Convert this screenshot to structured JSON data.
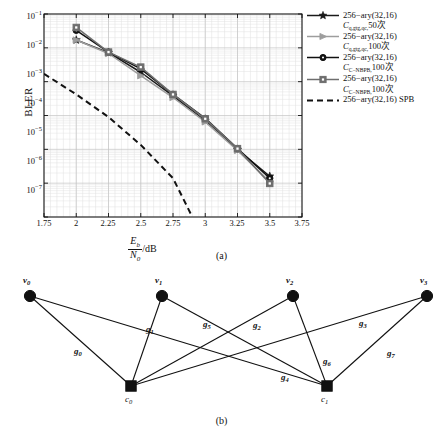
{
  "figure": {
    "panel_a_caption": "(a)",
    "panel_b_caption": "(b)"
  },
  "chart_data": {
    "type": "line",
    "title": "",
    "xlabel": "Eb/N0 /dB",
    "ylabel": "BLER",
    "xlim": [
      1.75,
      3.75
    ],
    "ylim": [
      1e-07,
      0.1
    ],
    "yscale": "log",
    "grid": true,
    "legend_position": "right-outside",
    "xticks": [
      "1.75",
      "2",
      "2.25",
      "2.5",
      "2.75",
      "3",
      "3.25",
      "3.5",
      "3.75"
    ],
    "xtick_values": [
      1.75,
      2,
      2.25,
      2.5,
      2.75,
      3,
      3.25,
      3.5,
      3.75
    ],
    "yticks": [
      "10-1",
      "10-2",
      "10-3",
      "10-4",
      "10-5",
      "10-6",
      "10-7"
    ],
    "ytick_values": [
      0.1,
      0.01,
      0.001,
      0.0001,
      1e-05,
      1e-06,
      1e-07
    ],
    "series": [
      {
        "name": "256-ary(32,16) C_q,gtg,qc, 50 times",
        "marker": "star",
        "color": "#1a1a1a",
        "linestyle": "solid",
        "x": [
          2,
          2.25,
          2.5,
          2.75,
          3,
          3.25,
          3.5
        ],
        "y": [
          0.017,
          0.0072,
          0.0019,
          0.00038,
          7e-05,
          9.8e-06,
          1.6e-06
        ]
      },
      {
        "name": "256-ary(32,16) C_q,gtg,qc, 100 times",
        "marker": "triangle-right",
        "color": "#9d9d9d",
        "linestyle": "solid",
        "x": [
          2,
          2.25,
          2.5,
          2.75,
          3,
          3.25,
          3.5
        ],
        "y": [
          0.017,
          0.0068,
          0.0015,
          0.00034,
          6.5e-05,
          9.3e-06,
          1.1e-06
        ]
      },
      {
        "name": "256-ary(32,16) C_C-NBPB, 100 times",
        "marker": "circle",
        "color": "#111111",
        "linestyle": "solid",
        "x": [
          2,
          2.25,
          2.5,
          2.75,
          3,
          3.25,
          3.5
        ],
        "y": [
          0.033,
          0.0075,
          0.0024,
          0.00042,
          8.2e-05,
          1.05e-05,
          1.4e-06
        ]
      },
      {
        "name": "256-ary(32,16) C_C-NBPB, 100 times",
        "marker": "square",
        "color": "#6e6e6e",
        "linestyle": "solid",
        "x": [
          2,
          2.25,
          2.5,
          2.75,
          3,
          3.25,
          3.5
        ],
        "y": [
          0.04,
          0.0075,
          0.0027,
          0.00042,
          8e-05,
          1.05e-05,
          9.8e-07
        ]
      },
      {
        "name": "256-ary(32,16) SPB",
        "marker": "none",
        "color": "#111111",
        "linestyle": "dashed",
        "x": [
          1.75,
          2.0,
          2.25,
          2.5,
          2.75,
          2.9
        ],
        "y": [
          0.0017,
          0.00042,
          9e-05,
          1.35e-05,
          1.4e-06,
          1e-07
        ]
      }
    ],
    "legend": [
      {
        "marker": "star",
        "color": "#1a1a1a",
        "line1": "256−ary(32,16)",
        "line2_sym": "C",
        "line2_sub": "q,gtg,qc,",
        "line2_rest": "50次"
      },
      {
        "marker": "triangle-right",
        "color": "#9d9d9d",
        "line1": "256−ary(32,16)",
        "line2_sym": "C",
        "line2_sub": "q,gtg,qc,",
        "line2_rest": "100次"
      },
      {
        "marker": "circle",
        "color": "#111111",
        "line1": "256−ary(32,16)",
        "line2_sym": "C",
        "line2_sub": "C−NBPB,",
        "line2_rest": "100次"
      },
      {
        "marker": "square",
        "color": "#6e6e6e",
        "line1": "256−ary(32,16)",
        "line2_sym": "C",
        "line2_sub": "C−NBPB,",
        "line2_rest": "100次"
      },
      {
        "marker": "dashed-line",
        "color": "#111111",
        "line1": "256−ary(32,16) SPB",
        "line2_sym": "",
        "line2_sub": "",
        "line2_rest": ""
      }
    ]
  },
  "graph_b": {
    "variable_nodes": [
      {
        "id": "v0",
        "label_sym": "v",
        "label_sub": "0",
        "x": 30,
        "y": 28
      },
      {
        "id": "v1",
        "label_sym": "v",
        "label_sub": "1",
        "x": 162,
        "y": 28
      },
      {
        "id": "v2",
        "label_sym": "v",
        "label_sub": "2",
        "x": 293,
        "y": 28
      },
      {
        "id": "v3",
        "label_sym": "v",
        "label_sub": "3",
        "x": 427,
        "y": 28
      }
    ],
    "check_nodes": [
      {
        "id": "c0",
        "label_sym": "c",
        "label_sub": "0",
        "x": 131,
        "y": 118
      },
      {
        "id": "c1",
        "label_sym": "c",
        "label_sub": "1",
        "x": 327,
        "y": 118
      }
    ],
    "edges": [
      {
        "from": "v0",
        "to": "c0",
        "label_sym": "g",
        "label_sub": "0",
        "lx": 74,
        "ly": 78
      },
      {
        "from": "v1",
        "to": "c0",
        "label_sym": "g",
        "label_sub": "1",
        "lx": 146,
        "ly": 56
      },
      {
        "from": "v2",
        "to": "c0",
        "label_sym": "g",
        "label_sub": "2",
        "lx": 253,
        "ly": 52
      },
      {
        "from": "v3",
        "to": "c0",
        "label_sym": "g",
        "label_sub": "3",
        "lx": 359,
        "ly": 50
      },
      {
        "from": "v0",
        "to": "c1",
        "label_sym": "g",
        "label_sub": "4",
        "lx": 281,
        "ly": 104
      },
      {
        "from": "v1",
        "to": "c1",
        "label_sym": "g",
        "label_sub": "5",
        "lx": 203,
        "ly": 51
      },
      {
        "from": "v2",
        "to": "c1",
        "label_sym": "g",
        "label_sub": "6",
        "lx": 323,
        "ly": 88
      },
      {
        "from": "v3",
        "to": "c1",
        "label_sym": "g",
        "label_sub": "7",
        "lx": 387,
        "ly": 80
      }
    ]
  }
}
